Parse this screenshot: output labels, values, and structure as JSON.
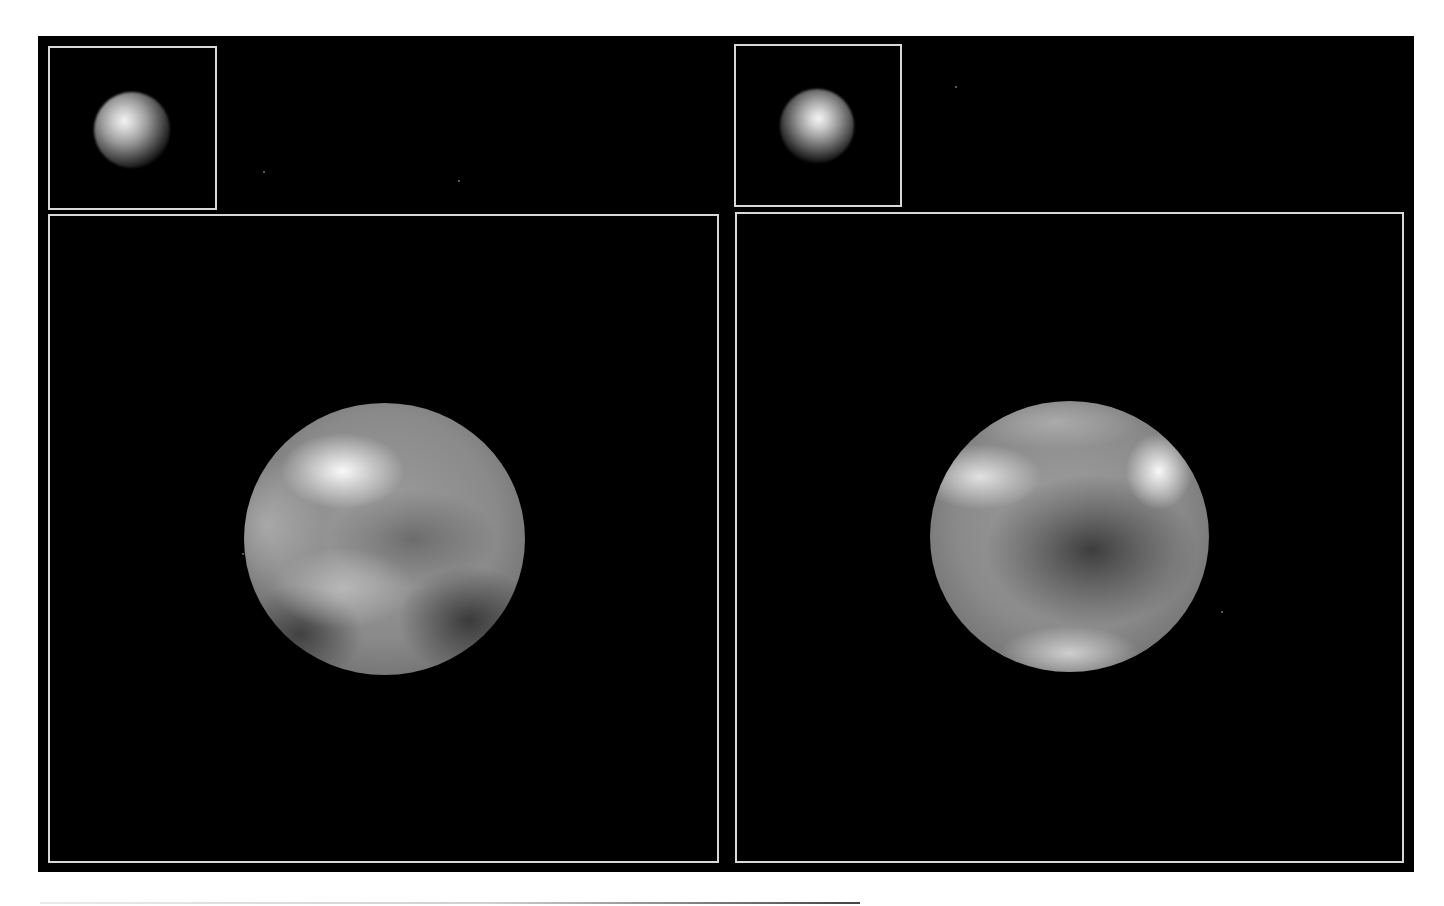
{
  "figure": {
    "background_color": "#000000",
    "border_color": "#d8d8d8",
    "panels": [
      {
        "id": "left",
        "thumbnail": {
          "label": "",
          "position": "top-left"
        },
        "globe": {
          "label": "",
          "highlight": "bright region upper-left"
        }
      },
      {
        "id": "right",
        "thumbnail": {
          "label": "",
          "position": "top-left"
        },
        "globe": {
          "label": "",
          "highlight": "bright regions upper-left and upper-right, dark band center"
        }
      }
    ]
  }
}
